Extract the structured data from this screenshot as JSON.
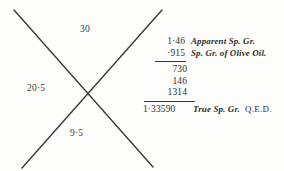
{
  "document": {
    "type": "worked-arithmetic-figure",
    "cross_diagram": {
      "name": "cross-multiplication-figure",
      "top_value": "30",
      "left_value": "20·5",
      "bottom_value": "9·5",
      "right_value": "",
      "stroke_color": "#3a3836"
    },
    "calculation": {
      "multiplicand": "1·46",
      "multiplicand_label": "Apparent Sp. Gr.",
      "multiplier": "·915",
      "multiplier_label": "Sp. Gr. of Olive Oil.",
      "partial_products": [
        "730",
        "146",
        "1314"
      ],
      "result": "1·33590",
      "result_label": "True Sp. Gr.",
      "qed": "Q.E.D."
    }
  }
}
